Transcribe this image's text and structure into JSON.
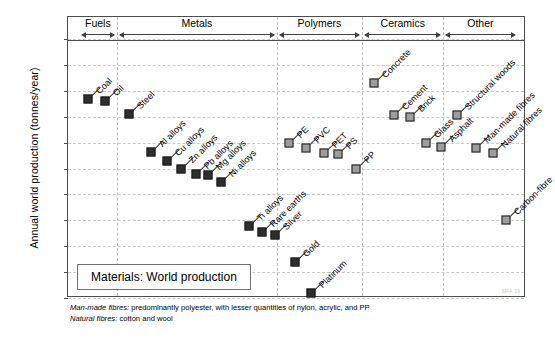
{
  "chart_data": {
    "type": "scatter",
    "title": "Materials: World production",
    "xlabel": "",
    "ylabel": "Annual world production (tonnes/year)",
    "ylim": [
      100,
      1000000000000
    ],
    "yscale": "log",
    "ytick_labels": [
      "10¹²",
      "10¹¹",
      "10¹⁰",
      "10⁹",
      "10⁸",
      "10⁷",
      "10⁶",
      "10⁵",
      "10⁴",
      "10³",
      "10²"
    ],
    "ytick_values": [
      1000000000000.0,
      100000000000.0,
      10000000000.0,
      1000000000.0,
      100000000.0,
      10000000.0,
      1000000.0,
      100000.0,
      10000.0,
      1000.0,
      100.0
    ],
    "grid": true,
    "legend": "none",
    "groups": [
      {
        "name": "Fuels",
        "x_start": 1.5,
        "x_end": 10.0
      },
      {
        "name": "Metals",
        "x_start": 10.0,
        "x_end": 45.5
      },
      {
        "name": "Polymers",
        "x_start": 45.5,
        "x_end": 64.5
      },
      {
        "name": "Ceramics",
        "x_start": 64.5,
        "x_end": 82.5
      },
      {
        "name": "Other",
        "x_start": 82.5,
        "x_end": 99.0
      }
    ],
    "points": [
      {
        "label": "Coal",
        "group": "Fuels",
        "x": 3.6,
        "value": 5000000000.0,
        "color": "dark"
      },
      {
        "label": "Oil",
        "group": "Fuels",
        "x": 7.4,
        "value": 4200000000.0,
        "color": "dark"
      },
      {
        "label": "Steel",
        "group": "Metals",
        "x": 12.6,
        "value": 1300000000.0,
        "color": "dark"
      },
      {
        "label": "Al alloys",
        "group": "Metals",
        "x": 17.6,
        "value": 45000000.0,
        "color": "dark"
      },
      {
        "label": "Cu alloys",
        "group": "Metals",
        "x": 21.0,
        "value": 20000000.0,
        "color": "dark"
      },
      {
        "label": "Zn alloys",
        "group": "Metals",
        "x": 24.3,
        "value": 10000000.0,
        "color": "dark"
      },
      {
        "label": "Pb alloys",
        "group": "Metals",
        "x": 27.6,
        "value": 6000000.0,
        "color": "dark"
      },
      {
        "label": "Mg alloys",
        "group": "Metals",
        "x": 30.2,
        "value": 5500000.0,
        "color": "dark"
      },
      {
        "label": "Ni alloys",
        "group": "Metals",
        "x": 33.0,
        "value": 3000000.0,
        "color": "dark"
      },
      {
        "label": "Ti alloys",
        "group": "Metals",
        "x": 39.4,
        "value": 60000.0,
        "color": "dark"
      },
      {
        "label": "Rare earths",
        "group": "Metals",
        "x": 42.2,
        "value": 35000.0,
        "color": "dark"
      },
      {
        "label": "Silver",
        "group": "Metals",
        "x": 45.0,
        "value": 26000.0,
        "color": "dark"
      },
      {
        "label": "Gold",
        "group": "Metals",
        "x": 49.5,
        "value": 2400.0,
        "color": "dark"
      },
      {
        "label": "Platinum",
        "group": "Metals",
        "x": 53.2,
        "value": 150.0,
        "color": "dark"
      },
      {
        "label": "PE",
        "group": "Polymers",
        "x": 48.3,
        "value": 100000000.0,
        "color": "gray"
      },
      {
        "label": "PVC",
        "group": "Polymers",
        "x": 52.0,
        "value": 60000000.0,
        "color": "gray"
      },
      {
        "label": "PET",
        "group": "Polymers",
        "x": 55.9,
        "value": 40000000.0,
        "color": "gray"
      },
      {
        "label": "PS",
        "group": "Polymers",
        "x": 59.2,
        "value": 35000000.0,
        "color": "gray"
      },
      {
        "label": "PP",
        "group": "Polymers",
        "x": 63.0,
        "value": 10000000.0,
        "color": "gray"
      },
      {
        "label": "Concrete",
        "group": "Ceramics",
        "x": 67.2,
        "value": 20000000000.0,
        "color": "gray"
      },
      {
        "label": "Cement",
        "group": "Ceramics",
        "x": 71.5,
        "value": 1200000000.0,
        "color": "gray"
      },
      {
        "label": "Brick",
        "group": "Ceramics",
        "x": 75.0,
        "value": 1000000000.0,
        "color": "gray"
      },
      {
        "label": "Glass",
        "group": "Ceramics",
        "x": 78.6,
        "value": 100000000.0,
        "color": "gray"
      },
      {
        "label": "Asphalt",
        "group": "Ceramics",
        "x": 82.0,
        "value": 70000000.0,
        "color": "gray"
      },
      {
        "label": "Structural woods",
        "group": "Other",
        "x": 85.6,
        "value": 1200000000.0,
        "color": "gray"
      },
      {
        "label": "Man-made fibres",
        "group": "Other",
        "x": 89.8,
        "value": 60000000.0,
        "color": "gray"
      },
      {
        "label": "Natural fibres",
        "group": "Other",
        "x": 93.5,
        "value": 40000000.0,
        "color": "gray"
      },
      {
        "label": "Carbon-fibre",
        "group": "Other",
        "x": 96.5,
        "value": 100000.0,
        "color": "gray"
      }
    ],
    "notes": [
      {
        "emph": "Man-made fibres:",
        "rest": " predominantly polyester, with lesser quantities of nylon, acrylic, and PP"
      },
      {
        "emph": "Natural fibres:",
        "rest": " cotton and wool"
      }
    ],
    "watermark": "MFA '19"
  }
}
